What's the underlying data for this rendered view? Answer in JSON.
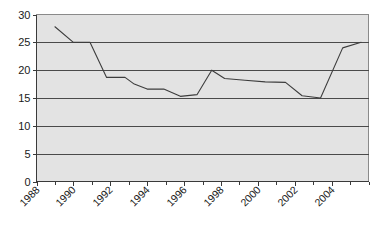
{
  "chart_data": {
    "type": "line",
    "title": "",
    "subtitle": "",
    "xlabel": "",
    "ylabel": "",
    "xlim": [
      1988,
      2006
    ],
    "ylim": [
      0,
      30
    ],
    "grid": true,
    "legend": "none",
    "y_ticks": [
      0,
      5,
      10,
      15,
      20,
      25,
      30
    ],
    "y_tick_labels": [
      "0",
      "5",
      "10",
      "15",
      "20",
      "25",
      "30"
    ],
    "x_ticks": [
      1988,
      1990,
      1992,
      1994,
      1996,
      1998,
      2000,
      2002,
      2004
    ],
    "x_tick_labels": [
      "1988",
      "1990",
      "1992",
      "1994",
      "1996",
      "1998",
      "2000",
      "2002",
      "2004"
    ],
    "x_tick_rotation": -45,
    "series": [
      {
        "name": "series-1",
        "color": "#3d3d3d",
        "x": [
          1989.0,
          1990.0,
          1990.9,
          1991.8,
          1992.8,
          1993.3,
          1994.0,
          1994.9,
          1995.8,
          1996.7,
          1997.5,
          1998.2,
          1999.3,
          2000.4,
          2001.5,
          2002.4,
          2003.4,
          2004.6,
          2005.6
        ],
        "y": [
          27.8,
          25.0,
          25.0,
          18.7,
          18.7,
          17.5,
          16.6,
          16.6,
          15.3,
          15.6,
          20.0,
          18.5,
          18.2,
          17.9,
          17.8,
          15.4,
          15.0,
          24.0,
          25.0
        ]
      }
    ]
  },
  "plot": {
    "x_axis_min": 1988,
    "x_axis_max": 2006,
    "y_axis_min": 0,
    "y_axis_max": 30,
    "background_color": "#e3e3e3",
    "gridline_color": "#4a4a4a",
    "frame_color": "#8a8a8a",
    "line_color": "#3d3d3d"
  }
}
